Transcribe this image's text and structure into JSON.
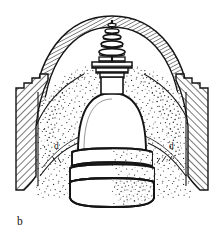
{
  "figure": {
    "caption_label": "b",
    "kind": "line-drawing-cross-section",
    "background_color": "#ffffff",
    "ink_color": "#121212",
    "labels": [
      {
        "id": "d-left",
        "text": "d"
      },
      {
        "id": "d-right",
        "text": "d"
      },
      {
        "id": "caption",
        "text": "b"
      }
    ],
    "parts": {
      "outer_dome": "outer-dome-shell",
      "left_wall": "left-cut-wall-hatched",
      "right_wall": "right-cut-wall-hatched",
      "fill": "stippled-fill",
      "inner_dome": "central-bell-dome",
      "drum_bands": "banded-drum",
      "base_cylinder": "base-cylinder",
      "plinth": "stepped-plinth",
      "finial": "stacked-disc-finial",
      "mast": "central-mast"
    }
  }
}
